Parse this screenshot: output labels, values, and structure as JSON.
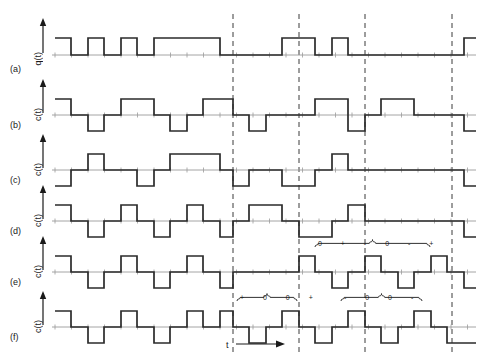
{
  "figure": {
    "title": "",
    "axis_time_label": "t",
    "rows": [
      {
        "tag": "(a)",
        "ylabel": "q(t)",
        "kind": "binary-data"
      },
      {
        "tag": "(b)",
        "ylabel": "c(t)",
        "kind": "line-code"
      },
      {
        "tag": "(c)",
        "ylabel": "c(t)",
        "kind": "line-code"
      },
      {
        "tag": "(d)",
        "ylabel": "c(t)",
        "kind": "line-code"
      },
      {
        "tag": "(e)",
        "ylabel": "c(t)",
        "kind": "line-code"
      },
      {
        "tag": "(f)",
        "ylabel": "c(t)",
        "kind": "line-code"
      }
    ],
    "annotations": [
      {
        "id": "ann-plus-zero-zero-plus",
        "symbols": [
          "+",
          "0",
          "0",
          "+"
        ],
        "text": "+  0  0  +"
      },
      {
        "id": "ann-zero-plus-minus-zero-minus-plus",
        "symbols": [
          "0",
          "+",
          "-",
          "0",
          "-",
          "+"
        ],
        "text": "0  +  -  0  -  +"
      },
      {
        "id": "ann-minus-zero-zero-minus",
        "symbols": [
          "-",
          "0",
          "0",
          "-"
        ],
        "text": "-  0  0  -"
      }
    ]
  },
  "chart_data": {
    "type": "line",
    "title": "",
    "xlabel": "t",
    "ylabel": "",
    "grid": false,
    "legend": null,
    "bit_interval_px": 16.5,
    "x_start_px": 55,
    "dashed_markers_px": [
      233,
      299,
      365,
      452
    ],
    "series": [
      {
        "name": "q(t)",
        "row": "(a)",
        "levels": [
          1,
          0
        ],
        "baseline_px": 55,
        "high_px": 38,
        "low_px": 70,
        "segments": [
          [
            55,
            1
          ],
          [
            71,
            0
          ],
          [
            88,
            1
          ],
          [
            104,
            0
          ],
          [
            121,
            1
          ],
          [
            137,
            0
          ],
          [
            154,
            1
          ],
          [
            170,
            1
          ],
          [
            187,
            1
          ],
          [
            203,
            1
          ],
          [
            220,
            0
          ],
          [
            233,
            0
          ],
          [
            249,
            0
          ],
          [
            266,
            0
          ],
          [
            282,
            1
          ],
          [
            299,
            1
          ],
          [
            315,
            0
          ],
          [
            332,
            1
          ],
          [
            348,
            0
          ],
          [
            365,
            0
          ],
          [
            381,
            0
          ],
          [
            398,
            0
          ],
          [
            414,
            0
          ],
          [
            431,
            0
          ],
          [
            447,
            0
          ],
          [
            464,
            1
          ]
        ]
      },
      {
        "name": "c(t)",
        "row": "(b)",
        "levels": [
          1,
          0,
          -1
        ],
        "baseline_px": 115,
        "high_px": 99,
        "low_px": 131,
        "segments": [
          [
            55,
            1
          ],
          [
            71,
            0
          ],
          [
            88,
            -1
          ],
          [
            104,
            0
          ],
          [
            121,
            1
          ],
          [
            137,
            1
          ],
          [
            154,
            0
          ],
          [
            170,
            -1
          ],
          [
            187,
            0
          ],
          [
            203,
            1
          ],
          [
            220,
            1
          ],
          [
            233,
            0
          ],
          [
            249,
            -1
          ],
          [
            266,
            0
          ],
          [
            282,
            0
          ],
          [
            299,
            0
          ],
          [
            315,
            1
          ],
          [
            332,
            1
          ],
          [
            348,
            -1
          ],
          [
            365,
            0
          ],
          [
            381,
            1
          ],
          [
            398,
            1
          ],
          [
            414,
            0
          ],
          [
            431,
            0
          ],
          [
            447,
            0
          ],
          [
            464,
            -1
          ]
        ]
      },
      {
        "name": "c(t)",
        "row": "(c)",
        "levels": [
          1,
          0,
          -1
        ],
        "baseline_px": 170,
        "high_px": 154,
        "low_px": 186,
        "segments": [
          [
            55,
            -1
          ],
          [
            71,
            0
          ],
          [
            88,
            1
          ],
          [
            104,
            0
          ],
          [
            121,
            0
          ],
          [
            137,
            -1
          ],
          [
            154,
            0
          ],
          [
            170,
            1
          ],
          [
            187,
            1
          ],
          [
            203,
            1
          ],
          [
            220,
            0
          ],
          [
            233,
            -1
          ],
          [
            249,
            0
          ],
          [
            266,
            0
          ],
          [
            282,
            -1
          ],
          [
            299,
            -1
          ],
          [
            315,
            0
          ],
          [
            332,
            1
          ],
          [
            348,
            0
          ],
          [
            365,
            0
          ],
          [
            381,
            0
          ],
          [
            398,
            0
          ],
          [
            414,
            0
          ],
          [
            431,
            0
          ],
          [
            447,
            0
          ],
          [
            464,
            -1
          ]
        ]
      },
      {
        "name": "c(t)",
        "row": "(d)",
        "levels": [
          1,
          0,
          -1
        ],
        "baseline_px": 221,
        "high_px": 205,
        "low_px": 237,
        "segments": [
          [
            55,
            1
          ],
          [
            71,
            0
          ],
          [
            88,
            -1
          ],
          [
            104,
            0
          ],
          [
            121,
            1
          ],
          [
            137,
            0
          ],
          [
            154,
            -1
          ],
          [
            170,
            0
          ],
          [
            187,
            1
          ],
          [
            203,
            0
          ],
          [
            220,
            -1
          ],
          [
            233,
            0
          ],
          [
            249,
            1
          ],
          [
            266,
            1
          ],
          [
            282,
            0
          ],
          [
            299,
            -1
          ],
          [
            315,
            -1
          ],
          [
            332,
            0
          ],
          [
            348,
            1
          ],
          [
            365,
            0
          ],
          [
            381,
            0
          ],
          [
            398,
            0
          ],
          [
            414,
            0
          ],
          [
            431,
            0
          ],
          [
            447,
            0
          ],
          [
            464,
            -1
          ]
        ]
      },
      {
        "name": "c(t)",
        "row": "(e)",
        "levels": [
          1,
          0,
          -1
        ],
        "baseline_px": 272,
        "high_px": 256,
        "low_px": 288,
        "segments": [
          [
            55,
            1
          ],
          [
            71,
            0
          ],
          [
            88,
            -1
          ],
          [
            104,
            0
          ],
          [
            121,
            1
          ],
          [
            137,
            0
          ],
          [
            154,
            -1
          ],
          [
            170,
            0
          ],
          [
            187,
            1
          ],
          [
            203,
            0
          ],
          [
            220,
            -1
          ],
          [
            233,
            0
          ],
          [
            249,
            0
          ],
          [
            266,
            0
          ],
          [
            282,
            0
          ],
          [
            299,
            1
          ],
          [
            315,
            0
          ],
          [
            332,
            -1
          ],
          [
            348,
            0
          ],
          [
            365,
            1
          ],
          [
            381,
            0
          ],
          [
            398,
            -1
          ],
          [
            414,
            0
          ],
          [
            431,
            1
          ],
          [
            447,
            0
          ],
          [
            464,
            -1
          ]
        ]
      },
      {
        "name": "c(t)",
        "row": "(f)",
        "levels": [
          1,
          0,
          -1
        ],
        "baseline_px": 327,
        "high_px": 311,
        "low_px": 343,
        "segments": [
          [
            55,
            1
          ],
          [
            71,
            0
          ],
          [
            88,
            -1
          ],
          [
            104,
            0
          ],
          [
            121,
            1
          ],
          [
            137,
            0
          ],
          [
            154,
            -1
          ],
          [
            170,
            0
          ],
          [
            187,
            1
          ],
          [
            203,
            0
          ],
          [
            220,
            1
          ],
          [
            233,
            0
          ],
          [
            249,
            -1
          ],
          [
            266,
            0
          ],
          [
            282,
            1
          ],
          [
            299,
            0
          ],
          [
            315,
            -1
          ],
          [
            332,
            0
          ],
          [
            348,
            1
          ],
          [
            365,
            0
          ],
          [
            381,
            -1
          ],
          [
            398,
            0
          ],
          [
            414,
            1
          ],
          [
            431,
            0
          ],
          [
            447,
            -1
          ],
          [
            464,
            -1
          ]
        ]
      }
    ]
  }
}
